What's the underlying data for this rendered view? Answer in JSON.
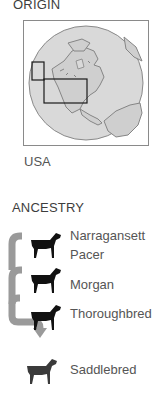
{
  "origin": {
    "heading": "ORIGIN",
    "country": "USA",
    "map": {
      "globe_fill": "#d6d6d6",
      "land_fill": "#c4c4c4",
      "outline": "#808080",
      "highlight_box": "#1a1a1a"
    }
  },
  "ancestry": {
    "heading": "ANCESTRY",
    "arrow_color": "#9a9a9a",
    "breeds": [
      {
        "line1": "Narragansett",
        "line2": "Pacer",
        "icon": "horse-icon",
        "color": "#111111"
      },
      {
        "line1": "Morgan",
        "line2": "",
        "icon": "horse-icon",
        "color": "#111111"
      },
      {
        "line1": "Thoroughbred",
        "line2": "",
        "icon": "horse-icon",
        "color": "#111111"
      },
      {
        "line1": "Saddlebred",
        "line2": "",
        "icon": "horse-icon",
        "color": "#3a3a3a"
      }
    ]
  }
}
